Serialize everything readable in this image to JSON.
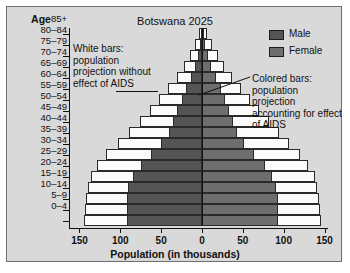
{
  "chart_data": {
    "type": "bar",
    "subtype": "population-pyramid",
    "title": "Botswana 2025",
    "xlabel": "Population (in thousands)",
    "ylabel": "Age",
    "xlim": [
      -150,
      150
    ],
    "xticks": [
      150,
      100,
      50,
      0,
      50,
      100,
      150
    ],
    "grid": false,
    "legend_position": "top-right",
    "categories": [
      "85+",
      "80–84",
      "75–79",
      "70–74",
      "65–69",
      "60–64",
      "55–59",
      "50–54",
      "45–49",
      "40–44",
      "35–39",
      "30–34",
      "25–29",
      "20–24",
      "15–19",
      "10–14",
      "5–9",
      "0–4"
    ],
    "series": [
      {
        "name": "Male",
        "note": "colored bars: projection accounting for effect of AIDS",
        "color": "#555555",
        "values": [
          1,
          3,
          5,
          9,
          14,
          20,
          25,
          31,
          36,
          41,
          50,
          62,
          75,
          85,
          90,
          92,
          92,
          92
        ]
      },
      {
        "name": "Female",
        "note": "colored bars: projection accounting for effect of AIDS",
        "color": "#6e6e6e",
        "values": [
          2,
          4,
          7,
          11,
          17,
          23,
          28,
          33,
          38,
          43,
          52,
          64,
          77,
          86,
          91,
          93,
          93,
          93
        ]
      },
      {
        "name": "Male without AIDS",
        "note": "white bars: projection without effect of AIDS",
        "color": "#fbfbfb",
        "values": [
          4,
          9,
          15,
          22,
          31,
          42,
          53,
          64,
          76,
          89,
          103,
          117,
          128,
          136,
          140,
          142,
          143,
          145
        ]
      },
      {
        "name": "Female without AIDS",
        "note": "white bars: projection without effect of AIDS",
        "color": "#fbfbfb",
        "values": [
          6,
          12,
          19,
          27,
          37,
          48,
          59,
          70,
          82,
          94,
          107,
          120,
          130,
          138,
          141,
          143,
          144,
          146
        ]
      }
    ]
  },
  "header": {
    "title": "Botswana 2025",
    "age_axis_label": "Age"
  },
  "legend": {
    "items": [
      {
        "label": "Male",
        "color": "#555555"
      },
      {
        "label": "Female",
        "color": "#6e6e6e"
      }
    ]
  },
  "annotations": {
    "left": "White bars: population projection without effect of AIDS",
    "right": "Colored bars: population projection accounting for effect of AIDS"
  },
  "xaxis": {
    "title": "Population (in thousands)",
    "ticks": [
      "150",
      "100",
      "50",
      "0",
      "50",
      "100",
      "150"
    ]
  }
}
